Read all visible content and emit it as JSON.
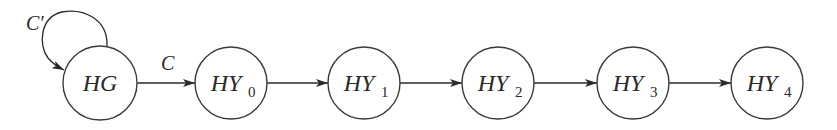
{
  "diagram": {
    "type": "state-transition-chain",
    "nodes": [
      {
        "id": "HG",
        "main": "HG",
        "sub": "",
        "cx": 100,
        "cy": 83,
        "r": 37
      },
      {
        "id": "HY0",
        "main": "HY",
        "sub": "0",
        "cx": 231,
        "cy": 83,
        "r": 36
      },
      {
        "id": "HY1",
        "main": "HY",
        "sub": "1",
        "cx": 364,
        "cy": 83,
        "r": 36
      },
      {
        "id": "HY2",
        "main": "HY",
        "sub": "2",
        "cx": 498,
        "cy": 83,
        "r": 36
      },
      {
        "id": "HY3",
        "main": "HY",
        "sub": "3",
        "cx": 633,
        "cy": 83,
        "r": 36
      },
      {
        "id": "HY4",
        "main": "HY",
        "sub": "4",
        "cx": 767,
        "cy": 83,
        "r": 36
      }
    ],
    "edges": [
      {
        "from": "HG",
        "to": "HG",
        "label": "C′",
        "self_loop": true
      },
      {
        "from": "HG",
        "to": "HY0",
        "label": "C"
      },
      {
        "from": "HY0",
        "to": "HY1",
        "label": ""
      },
      {
        "from": "HY1",
        "to": "HY2",
        "label": ""
      },
      {
        "from": "HY2",
        "to": "HY3",
        "label": ""
      },
      {
        "from": "HY3",
        "to": "HY4",
        "label": ""
      }
    ],
    "labels": {
      "self_loop": "C′",
      "hg_to_hy0": "C",
      "n0_main": "HG",
      "n1_main": "HY",
      "n1_sub": "0",
      "n2_main": "HY",
      "n2_sub": "1",
      "n3_main": "HY",
      "n3_sub": "2",
      "n4_main": "HY",
      "n4_sub": "3",
      "n5_main": "HY",
      "n5_sub": "4"
    },
    "colors": {
      "stroke": "#2a2a2a",
      "background": "#ffffff"
    }
  }
}
